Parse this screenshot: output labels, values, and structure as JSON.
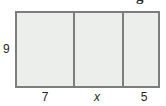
{
  "figure": {
    "type": "composite-rectangle-diagram",
    "cropped_heading_glyph": "g",
    "colors": {
      "stroke": "#7d7d7d",
      "fill": "#eceeec",
      "text": "#231f20",
      "background": "#ffffff"
    },
    "height_label": "9",
    "width_labels": [
      "7",
      "x",
      "5"
    ],
    "segments": [
      {
        "label": "7",
        "position": "left"
      },
      {
        "label": "x",
        "position": "middle"
      },
      {
        "label": "5",
        "position": "right"
      }
    ]
  }
}
